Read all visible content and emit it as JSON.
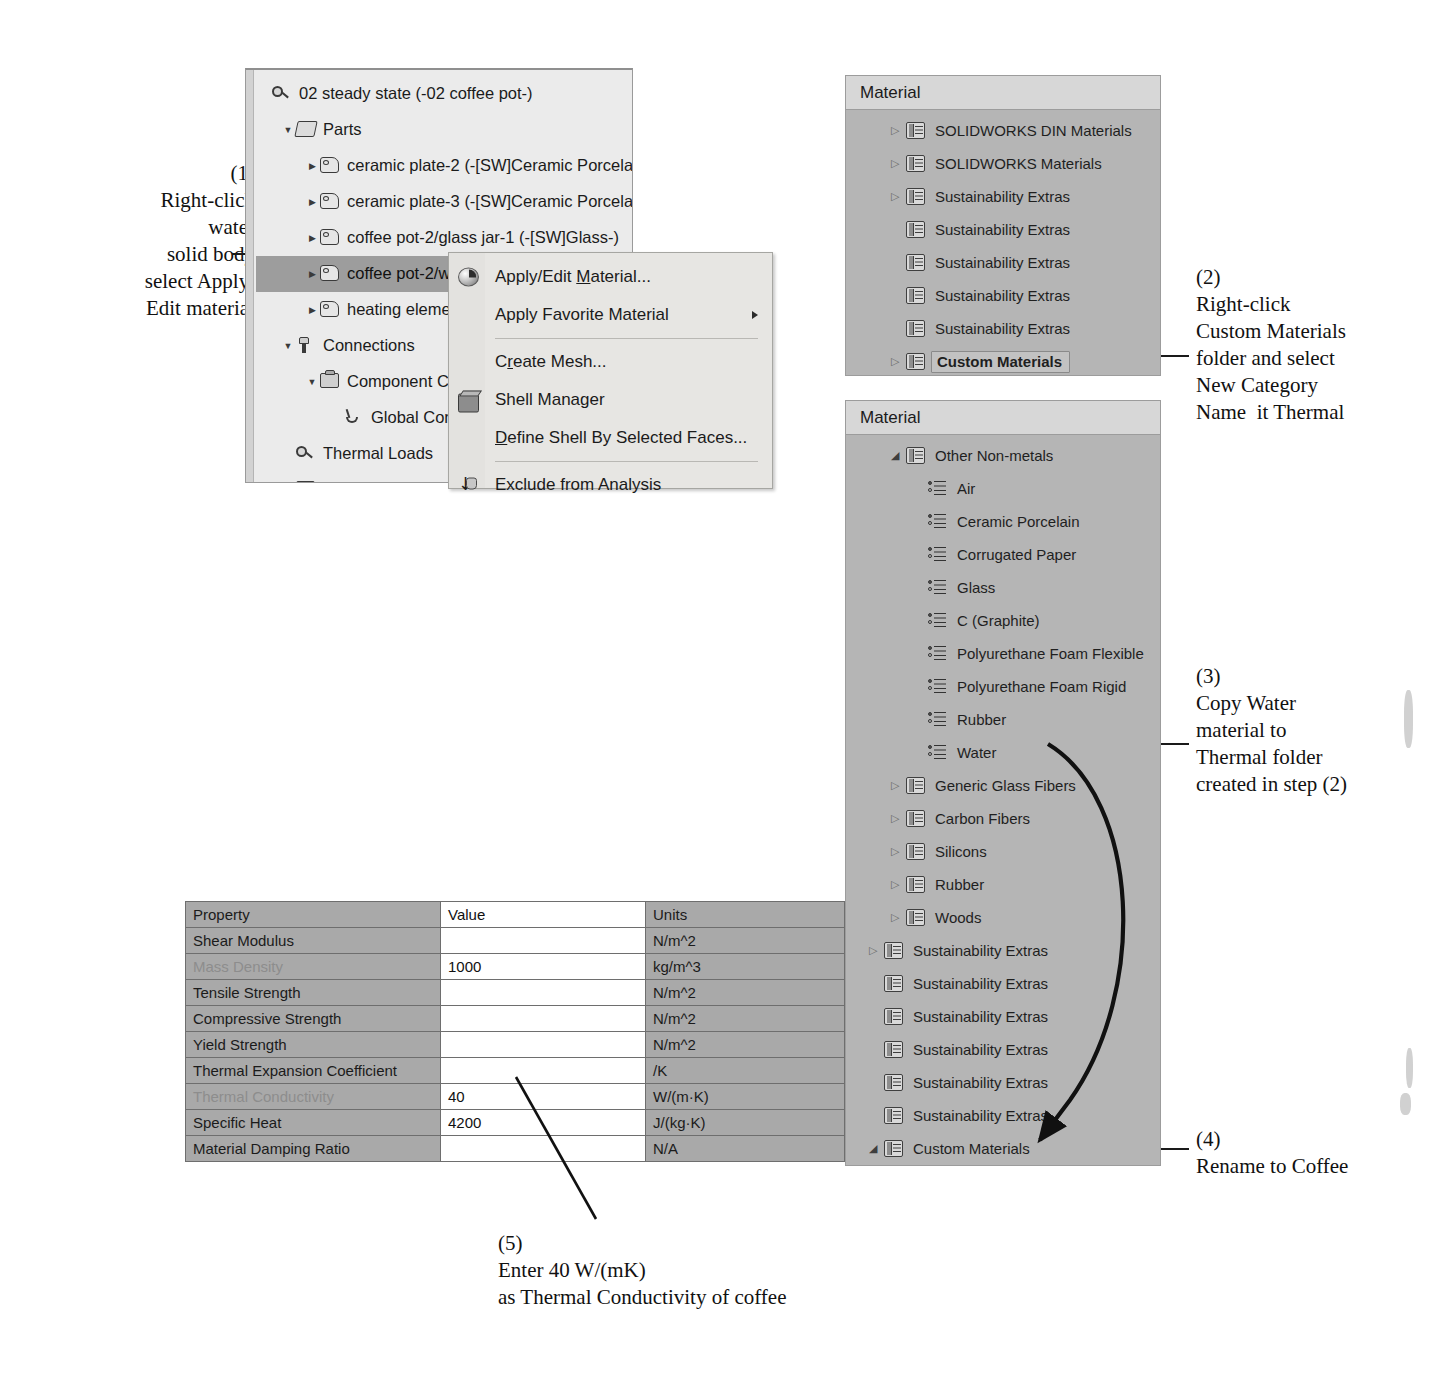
{
  "annotations": [
    {
      "id": "step1",
      "number": "(1)",
      "lines": [
        "Right-click",
        "water",
        "solid body",
        "select Apply/",
        "Edit material"
      ]
    },
    {
      "id": "step2",
      "number": "(2)",
      "lines": [
        "Right-click",
        "Custom Materials",
        "folder and select",
        "New Category",
        "Name  it Thermal"
      ]
    },
    {
      "id": "step3",
      "number": "(3)",
      "lines": [
        "Copy Water",
        "material to",
        "Thermal folder",
        "created in step (2)"
      ]
    },
    {
      "id": "step4",
      "number": "(4)",
      "lines": [
        "Rename to Coffee"
      ]
    },
    {
      "id": "step5",
      "number": "(5)",
      "lines": [
        "Enter 40 W/(mK)",
        "as Thermal Conductivity of coffee"
      ]
    }
  ],
  "feature_tree": {
    "rows": [
      {
        "label": "02 steady state (-02 coffee pot-)",
        "indent": 0,
        "expander": "none",
        "icon": "study-icon",
        "selected": false
      },
      {
        "label": "Parts",
        "indent": 1,
        "expander": "open",
        "icon": "parts-icon",
        "selected": false
      },
      {
        "label": "ceramic plate-2 (-[SW]Ceramic Porcelain",
        "indent": 2,
        "expander": "closed",
        "icon": "solid-body-icon",
        "selected": false
      },
      {
        "label": "ceramic plate-3 (-[SW]Ceramic Porcelain",
        "indent": 2,
        "expander": "closed",
        "icon": "solid-body-icon",
        "selected": false
      },
      {
        "label": "coffee pot-2/glass jar-1 (-[SW]Glass-)",
        "indent": 2,
        "expander": "closed",
        "icon": "solid-body-icon",
        "selected": false
      },
      {
        "label": "coffee pot-2/wa",
        "indent": 2,
        "expander": "closed",
        "icon": "solid-body-icon",
        "selected": true
      },
      {
        "label": "heating elemen",
        "indent": 2,
        "expander": "closed",
        "icon": "solid-body-icon",
        "selected": false
      },
      {
        "label": "Connections",
        "indent": 1,
        "expander": "open",
        "icon": "connections-icon",
        "selected": false
      },
      {
        "label": "Component Cor",
        "indent": 2,
        "expander": "open",
        "icon": "component-contact-icon",
        "selected": false
      },
      {
        "label": "Global Cont",
        "indent": 3,
        "expander": "none",
        "icon": "global-contact-icon",
        "selected": false
      },
      {
        "label": "Thermal Loads",
        "indent": 1,
        "expander": "none",
        "icon": "study-icon",
        "selected": false
      },
      {
        "label": "Mesh",
        "indent": 1,
        "expander": "none",
        "icon": "mesh-icon",
        "selected": false
      }
    ]
  },
  "context_menu": {
    "items": [
      {
        "type": "item",
        "label": "Apply/Edit Material...",
        "icon": "sphere-material-icon",
        "submenu": false,
        "accel_index": 11
      },
      {
        "type": "item",
        "label": "Apply Favorite Material",
        "icon": "none",
        "submenu": true,
        "accel_index": -1
      },
      {
        "type": "separator"
      },
      {
        "type": "item",
        "label": "Create Mesh...",
        "icon": "none",
        "submenu": false,
        "accel_index": 1
      },
      {
        "type": "item",
        "label": "Shell Manager",
        "icon": "shell-box-icon",
        "submenu": false,
        "accel_index": -1
      },
      {
        "type": "item",
        "label": "Define Shell By Selected Faces...",
        "icon": "none",
        "submenu": false,
        "accel_index": 0
      },
      {
        "type": "separator"
      },
      {
        "type": "item",
        "label": "Exclude from Analysis",
        "icon": "exclude-arrow-icon",
        "submenu": false,
        "accel_index": -1
      }
    ]
  },
  "material_panel_top": {
    "header": "Material",
    "rows": [
      {
        "label": "SOLIDWORKS DIN Materials",
        "indent": 0,
        "expander": "closed",
        "icon": "category-folder-icon",
        "bold": false,
        "boxed": false
      },
      {
        "label": "SOLIDWORKS Materials",
        "indent": 0,
        "expander": "closed",
        "icon": "category-folder-icon",
        "bold": false,
        "boxed": false
      },
      {
        "label": "Sustainability Extras",
        "indent": 0,
        "expander": "closed",
        "icon": "category-folder-icon",
        "bold": false,
        "boxed": false
      },
      {
        "label": "Sustainability Extras",
        "indent": 0,
        "expander": "none",
        "icon": "category-folder-icon",
        "bold": false,
        "boxed": false
      },
      {
        "label": "Sustainability Extras",
        "indent": 0,
        "expander": "none",
        "icon": "category-folder-icon",
        "bold": false,
        "boxed": false
      },
      {
        "label": "Sustainability Extras",
        "indent": 0,
        "expander": "none",
        "icon": "category-folder-icon",
        "bold": false,
        "boxed": false
      },
      {
        "label": "Sustainability Extras",
        "indent": 0,
        "expander": "none",
        "icon": "category-folder-icon",
        "bold": false,
        "boxed": false
      },
      {
        "label": "Custom Materials",
        "indent": 0,
        "expander": "closed",
        "icon": "category-folder-icon",
        "bold": true,
        "boxed": true
      }
    ]
  },
  "material_panel_bottom": {
    "header": "Material",
    "rows": [
      {
        "label": "Other Non-metals",
        "indent": 0,
        "expander": "open",
        "icon": "category-folder-icon",
        "bold": false,
        "boxed": false
      },
      {
        "label": "Air",
        "indent": 1,
        "expander": "none",
        "icon": "material-leaf-icon",
        "bold": false,
        "boxed": false
      },
      {
        "label": "Ceramic Porcelain",
        "indent": 1,
        "expander": "none",
        "icon": "material-leaf-icon",
        "bold": false,
        "boxed": false
      },
      {
        "label": "Corrugated Paper",
        "indent": 1,
        "expander": "none",
        "icon": "material-leaf-icon",
        "bold": false,
        "boxed": false
      },
      {
        "label": "Glass",
        "indent": 1,
        "expander": "none",
        "icon": "material-leaf-icon",
        "bold": false,
        "boxed": false
      },
      {
        "label": "C (Graphite)",
        "indent": 1,
        "expander": "none",
        "icon": "material-leaf-icon",
        "bold": false,
        "boxed": false
      },
      {
        "label": "Polyurethane Foam Flexible",
        "indent": 1,
        "expander": "none",
        "icon": "material-leaf-icon",
        "bold": false,
        "boxed": false
      },
      {
        "label": "Polyurethane Foam Rigid",
        "indent": 1,
        "expander": "none",
        "icon": "material-leaf-icon",
        "bold": false,
        "boxed": false
      },
      {
        "label": "Rubber",
        "indent": 1,
        "expander": "none",
        "icon": "material-leaf-icon",
        "bold": false,
        "boxed": false
      },
      {
        "label": "Water",
        "indent": 1,
        "expander": "none",
        "icon": "material-leaf-icon",
        "bold": false,
        "boxed": false
      },
      {
        "label": "Generic Glass Fibers",
        "indent": 0,
        "expander": "closed",
        "icon": "category-folder-icon",
        "bold": false,
        "boxed": false
      },
      {
        "label": "Carbon Fibers",
        "indent": 0,
        "expander": "closed",
        "icon": "category-folder-icon",
        "bold": false,
        "boxed": false
      },
      {
        "label": "Silicons",
        "indent": 0,
        "expander": "closed",
        "icon": "category-folder-icon",
        "bold": false,
        "boxed": false
      },
      {
        "label": "Rubber",
        "indent": 0,
        "expander": "closed",
        "icon": "category-folder-icon",
        "bold": false,
        "boxed": false
      },
      {
        "label": "Woods",
        "indent": 0,
        "expander": "closed",
        "icon": "category-folder-icon",
        "bold": false,
        "boxed": false
      },
      {
        "label": "Sustainability Extras",
        "indent": -1,
        "expander": "closed",
        "icon": "category-folder-icon",
        "bold": false,
        "boxed": false
      },
      {
        "label": "Sustainability Extras",
        "indent": -1,
        "expander": "none",
        "icon": "category-folder-icon",
        "bold": false,
        "boxed": false
      },
      {
        "label": "Sustainability Extras",
        "indent": -1,
        "expander": "none",
        "icon": "category-folder-icon",
        "bold": false,
        "boxed": false
      },
      {
        "label": "Sustainability Extras",
        "indent": -1,
        "expander": "none",
        "icon": "category-folder-icon",
        "bold": false,
        "boxed": false
      },
      {
        "label": "Sustainability Extras",
        "indent": -1,
        "expander": "none",
        "icon": "category-folder-icon",
        "bold": false,
        "boxed": false
      },
      {
        "label": "Sustainability Extras",
        "indent": -1,
        "expander": "none",
        "icon": "category-folder-icon",
        "bold": false,
        "boxed": false
      },
      {
        "label": "Custom Materials",
        "indent": -1,
        "expander": "open",
        "icon": "category-folder-icon",
        "bold": false,
        "boxed": false
      },
      {
        "label": "Thermal",
        "indent": 0,
        "expander": "open",
        "icon": "category-folder-icon",
        "bold": true,
        "boxed": true
      },
      {
        "label": "Coffee",
        "indent": 1,
        "expander": "none",
        "icon": "material-leaf-icon",
        "bold": false,
        "boxed": false
      }
    ]
  },
  "property_table": {
    "headers": [
      "Property",
      "Value",
      "Units"
    ],
    "rows": [
      {
        "property": "Shear Modulus",
        "value": "",
        "units": "N/m^2",
        "dim": false
      },
      {
        "property": "Mass Density",
        "value": "1000",
        "units": "kg/m^3",
        "dim": true
      },
      {
        "property": "Tensile Strength",
        "value": "",
        "units": "N/m^2",
        "dim": false
      },
      {
        "property": "Compressive Strength",
        "value": "",
        "units": "N/m^2",
        "dim": false
      },
      {
        "property": "Yield Strength",
        "value": "",
        "units": "N/m^2",
        "dim": false
      },
      {
        "property": "Thermal Expansion Coefficient",
        "value": "",
        "units": "/K",
        "dim": false
      },
      {
        "property": "Thermal Conductivity",
        "value": "40",
        "units": "W/(m·K)",
        "dim": true
      },
      {
        "property": "Specific Heat",
        "value": "4200",
        "units": "J/(kg·K)",
        "dim": false
      },
      {
        "property": "Material Damping Ratio",
        "value": "",
        "units": "N/A",
        "dim": false
      }
    ]
  },
  "colors": {
    "panel_bg": "#b5b5b5",
    "panel_header": "#d7d7d7",
    "tree_bg": "#ebebeb",
    "selection": "#9d9d9d",
    "menu_bg": "#e7e6e3",
    "table_prop": "#a9a9a9",
    "table_value": "#ffffff",
    "dim_text": "#8d8d8d"
  }
}
